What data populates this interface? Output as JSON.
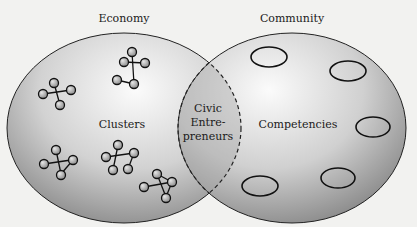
{
  "diagram": {
    "type": "venn",
    "left_circle": {
      "label": "Economy",
      "inner_label": "Clusters"
    },
    "right_circle": {
      "label": "Community",
      "inner_label": "Competencies"
    },
    "intersection": {
      "lines": [
        "Civic",
        "Entre-",
        "preneurs"
      ]
    }
  },
  "colors": {
    "background": "#f2f2f0",
    "circle_light": "#fafafa",
    "circle_dark": "#8c8c8c",
    "outline": "#222222",
    "node": "#a8a8a8"
  }
}
